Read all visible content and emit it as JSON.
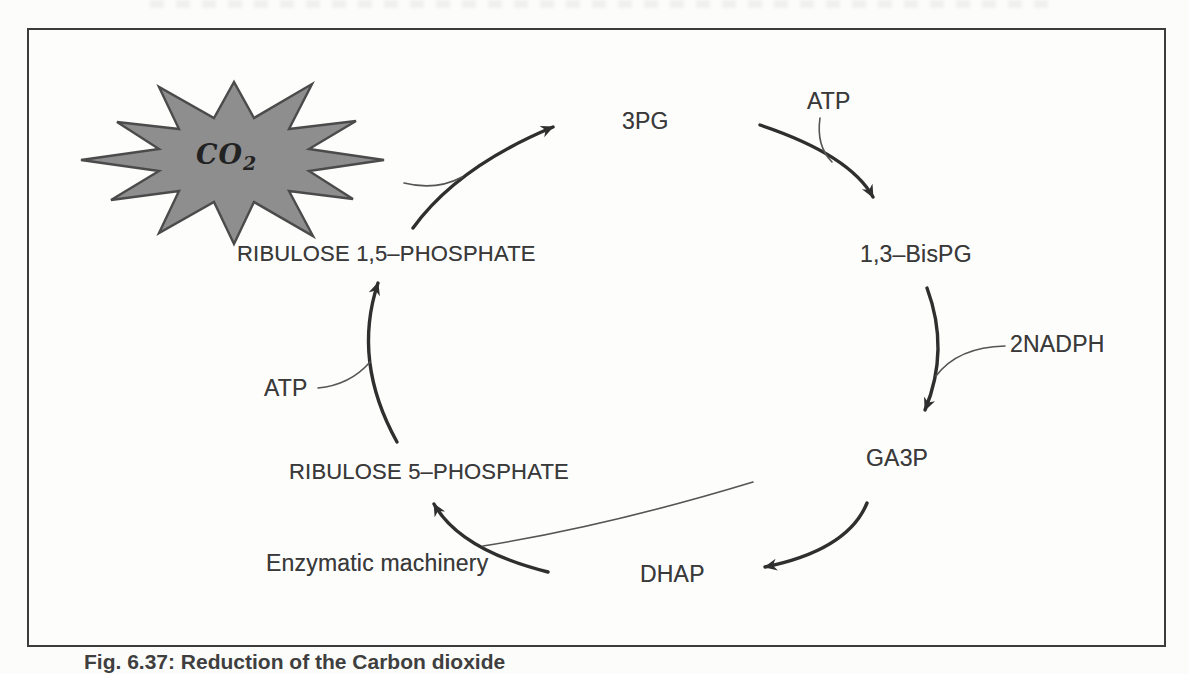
{
  "figure": {
    "type": "cycle-diagram",
    "caption": "Fig. 6.37: Reduction of the Carbon dioxide",
    "co2_burst": {
      "formula": "CO",
      "subscript": "2"
    },
    "nodes": [
      {
        "id": "3pg",
        "label": "3PG"
      },
      {
        "id": "1-3-bispg",
        "label": "1,3–BisPG"
      },
      {
        "id": "ga3p",
        "label": "GA3P"
      },
      {
        "id": "dhap",
        "label": "DHAP"
      },
      {
        "id": "ribulose-5-phosphate",
        "label": "RIBULOSE 5–PHOSPHATE"
      },
      {
        "id": "ribulose-1-5-phosphate",
        "label": "RIBULOSE 1,5–PHOSPHATE"
      }
    ],
    "cofactors": [
      {
        "id": "atp-top",
        "label": "ATP"
      },
      {
        "id": "nadph",
        "label": "2NADPH"
      },
      {
        "id": "atp-left",
        "label": "ATP"
      },
      {
        "id": "enzymatic-machinery",
        "label": "Enzymatic machinery"
      }
    ],
    "colors": {
      "ink": "#3a3a3a",
      "arrow": "#2f2f2f",
      "thin_line": "#555555",
      "burst_fill": "#8e8e8e",
      "burst_stroke": "#4b4b4b",
      "frame_border": "#3c3c3c",
      "background": "#fdfdfc"
    }
  }
}
